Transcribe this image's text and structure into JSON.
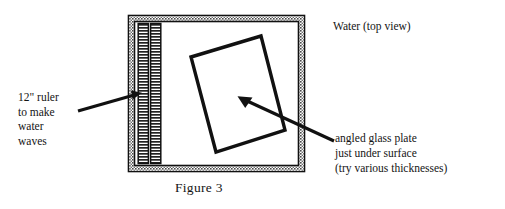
{
  "figure": {
    "caption": "Figure 3",
    "background_color": "#ffffff",
    "ink_color": "#1a1a1a",
    "border_fill_color": "#8c8c8c"
  },
  "labels": {
    "ruler": {
      "lines": [
        "12\" ruler",
        "to make",
        "water",
        "waves"
      ],
      "name": "ruler-label"
    },
    "water": {
      "text": "Water (top view)",
      "name": "water-label"
    },
    "plate": {
      "lines": [
        "angled glass plate",
        "just under surface",
        "(try various thicknesses)"
      ],
      "name": "glass-plate-label"
    }
  },
  "diagram": {
    "tank": {
      "name": "water-tank",
      "outer": {
        "x": 128,
        "y": 15,
        "width": 177,
        "height": 157
      },
      "wall_thickness": 7
    },
    "ruler": {
      "name": "ruler",
      "strips": [
        {
          "x": 139,
          "y": 24,
          "width": 9,
          "height": 139
        },
        {
          "x": 151,
          "y": 24,
          "width": 9,
          "height": 139
        }
      ],
      "tick_spacing": 3
    },
    "glass_plate": {
      "name": "angled-glass-plate",
      "points": "191,57 261,36 285,130 216,152",
      "stroke_width": 3.4
    },
    "arrows": [
      {
        "name": "ruler-arrow",
        "from": {
          "x": 78,
          "y": 111
        },
        "to": {
          "x": 141,
          "y": 93
        }
      },
      {
        "name": "glass-plate-arrow",
        "from": {
          "x": 334,
          "y": 141
        },
        "to": {
          "x": 239,
          "y": 97
        }
      }
    ]
  }
}
